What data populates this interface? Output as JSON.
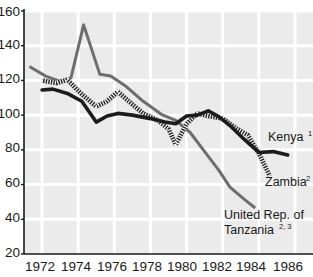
{
  "chart_data": {
    "type": "line",
    "title": "",
    "xlabel": "",
    "ylabel": "",
    "xlim": [
      1971.0,
      1987.0
    ],
    "ylim": [
      20,
      160
    ],
    "grid": true,
    "legend_position": "inline-right",
    "x_ticks": [
      1972,
      1974,
      1976,
      1978,
      1980,
      1982,
      1984,
      1986
    ],
    "y_ticks": [
      20,
      40,
      60,
      80,
      100,
      120,
      140,
      160
    ],
    "series": [
      {
        "name": "Kenya",
        "superscript": "1",
        "style": "solid-black",
        "color": "#1c1c1c",
        "label_x": 1985.0,
        "label_y": 89,
        "x": [
          1972.0,
          1972.6,
          1973.4,
          1974.2,
          1975.0,
          1975.6,
          1976.2,
          1977.0,
          1978.0,
          1978.8,
          1979.4,
          1980.0,
          1980.6,
          1981.2,
          1981.8,
          1982.4,
          1983.2,
          1984.0,
          1984.8,
          1985.6
        ],
        "y": [
          114.5,
          115.0,
          112.5,
          108.0,
          96.0,
          99.5,
          101.0,
          100.0,
          98.0,
          96.0,
          95.0,
          99.5,
          100.0,
          102.5,
          99.0,
          94.0,
          86.0,
          78.5,
          79.0,
          77.0
        ]
      },
      {
        "name": "Zambia",
        "superscript": "2",
        "style": "hatched",
        "color": "#2b2b2b",
        "label_x": 1985.1,
        "label_y": 59,
        "x": [
          1972.0,
          1972.8,
          1973.4,
          1974.2,
          1975.0,
          1975.6,
          1976.2,
          1976.8,
          1977.6,
          1978.4,
          1979.0,
          1979.4,
          1980.0,
          1980.6,
          1981.2,
          1982.0,
          1982.8,
          1983.4,
          1984.0,
          1984.6
        ],
        "y": [
          120.0,
          118.5,
          120.5,
          112.0,
          105.0,
          108.0,
          113.5,
          108.0,
          101.0,
          97.0,
          92.0,
          83.0,
          95.0,
          101.0,
          99.5,
          98.0,
          92.0,
          88.5,
          78.0,
          65.0
        ]
      },
      {
        "name": "United Rep. of Tanzania",
        "name_line1": "United Rep. of",
        "name_line2": "Tanzania",
        "superscript": "2, 3",
        "style": "solid-gray",
        "color": "#6e6e6e",
        "label_x": 1982.3,
        "label_y": 41,
        "x": [
          1971.3,
          1972.2,
          1973.0,
          1973.6,
          1974.3,
          1975.2,
          1975.8,
          1976.6,
          1977.6,
          1978.6,
          1979.4,
          1980.2,
          1981.0,
          1981.8,
          1982.4,
          1983.2,
          1983.8
        ],
        "y": [
          128.0,
          122.5,
          119.5,
          121.5,
          152.0,
          123.5,
          122.5,
          117.0,
          108.0,
          100.5,
          97.0,
          90.0,
          79.0,
          68.0,
          58.5,
          51.5,
          46.5
        ]
      }
    ]
  },
  "axes": {
    "y_tick_labels": [
      "160",
      "140",
      "120",
      "100",
      "80",
      "60",
      "40",
      "20"
    ],
    "x_tick_labels": [
      "1972",
      "1974",
      "1976",
      "1978",
      "1980",
      "1982",
      "1984",
      "1986"
    ]
  },
  "labels": {
    "kenya": "Kenya",
    "kenya_sup": "1",
    "zambia": "Zambia",
    "zambia_sup": "2",
    "tanzania_line1": "United Rep. of",
    "tanzania_line2": "Tanzania",
    "tanzania_sup": "2, 3"
  },
  "colors": {
    "plot_background": "#ebebeb",
    "gridline": "#ffffff",
    "axis": "#1a1a1a",
    "kenya": "#1c1c1c",
    "zambia": "#2b2b2b",
    "tanzania": "#6e6e6e",
    "page_background": "#ffffff"
  }
}
